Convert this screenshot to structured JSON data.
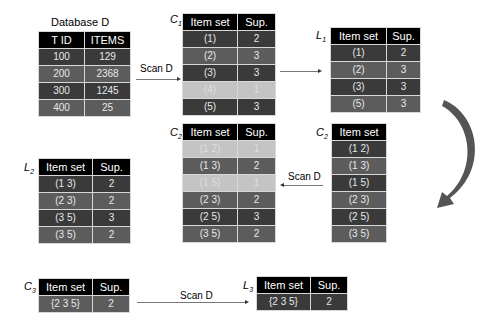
{
  "database": {
    "title": "Database D",
    "headers": [
      "T ID",
      "ITEMS"
    ],
    "rows": [
      [
        "100",
        "129"
      ],
      [
        "200",
        "2368"
      ],
      [
        "300",
        "1245"
      ],
      [
        "400",
        "25"
      ]
    ]
  },
  "c1": {
    "label": "C",
    "sub": "1",
    "headers": [
      "Item set",
      "Sup."
    ],
    "rows": [
      [
        "(1)",
        "2"
      ],
      [
        "(2)",
        "3"
      ],
      [
        "(3)",
        "3"
      ],
      [
        "(4)",
        "1"
      ],
      [
        "(5)",
        "3"
      ]
    ]
  },
  "l1": {
    "label": "L",
    "sub": "1",
    "headers": [
      "Item set",
      "Sup."
    ],
    "rows": [
      [
        "(1)",
        "2"
      ],
      [
        "(2)",
        "3"
      ],
      [
        "(3)",
        "3"
      ],
      [
        "(5)",
        "3"
      ]
    ]
  },
  "c2_candidates": {
    "label": "C",
    "sub": "2",
    "headers": [
      "Item set"
    ],
    "rows": [
      "(1 2)",
      "(1 3)",
      "(1 5)",
      "(2 3)",
      "(2 5)",
      "(3 5)"
    ]
  },
  "c2_counted": {
    "label": "C",
    "sub": "2",
    "headers": [
      "Item set",
      "Sup."
    ],
    "rows": [
      [
        "(1 2)",
        "1"
      ],
      [
        "(1 3)",
        "2"
      ],
      [
        "(1 5)",
        "1"
      ],
      [
        "(2 3)",
        "2"
      ],
      [
        "(2 5)",
        "3"
      ],
      [
        "(3 5)",
        "2"
      ]
    ]
  },
  "l2": {
    "label": "L",
    "sub": "2",
    "headers": [
      "Item set",
      "Sup."
    ],
    "rows": [
      [
        "(1 3)",
        "2"
      ],
      [
        "(2 3)",
        "2"
      ],
      [
        "(3 5)",
        "3"
      ],
      [
        "(3 5)",
        "2"
      ]
    ]
  },
  "c3": {
    "label": "C",
    "sub": "3",
    "headers": [
      "Item set",
      "Sup."
    ],
    "rows": [
      [
        "{2 3 5}",
        "2"
      ]
    ]
  },
  "l3": {
    "label": "L",
    "sub": "3",
    "headers": [
      "Item set",
      "Sup."
    ],
    "rows": [
      [
        "{2 3 5}",
        "2"
      ]
    ]
  },
  "arrows": {
    "scan1": "Scan D",
    "scan2": "Scan D",
    "scan3": "Scan D"
  },
  "colors": {
    "header": "#000000",
    "row_dark": "#3a3a3a",
    "row_mid": "#5c5c5c",
    "row_pruned": "#c4c4c4",
    "curved_arrow": "#555555"
  }
}
